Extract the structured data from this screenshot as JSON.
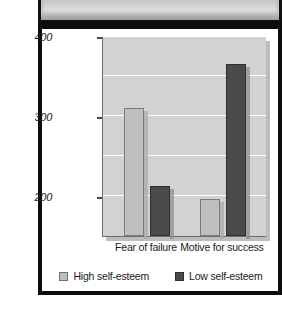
{
  "chart_data": {
    "type": "bar",
    "title": "",
    "xlabel": "",
    "ylabel": "Amount of practice time (in seconds)",
    "categories": [
      "Fear of failure",
      "Motive for success"
    ],
    "series": [
      {
        "name": "High self-esteem",
        "color": "#bfbfbf",
        "values": [
          310,
          196
        ]
      },
      {
        "name": "Low self-esteem",
        "color": "#4a4a4a",
        "values": [
          212,
          365
        ]
      }
    ],
    "ylim": [
      150,
      400
    ],
    "yticks": [
      200,
      300,
      400
    ],
    "ytick_labels": [
      "200",
      "300",
      "400"
    ],
    "gridlines": [
      200,
      250,
      300,
      350,
      400
    ],
    "grid": true,
    "legend_position": "bottom",
    "plot_background": "#d2d2d2",
    "gridline_color": "#ffffff"
  },
  "legend": {
    "items": [
      {
        "label": "High self-esteem",
        "swatch": "light"
      },
      {
        "label": "Low self-esteem",
        "swatch": "dark"
      }
    ]
  },
  "frame": {
    "border_color": "#0d0d0d",
    "card_background": "#ffffff"
  }
}
